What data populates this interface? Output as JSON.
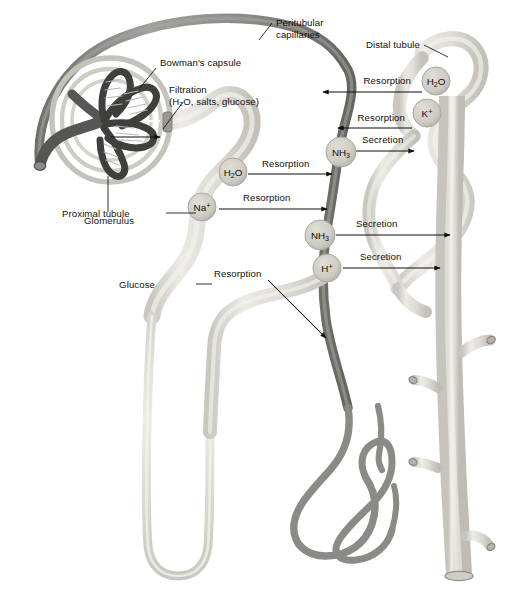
{
  "palette": {
    "background": "#ffffff",
    "tubule_fill": "#d8d6cf",
    "tubule_fill_light": "#e6e4dd",
    "tubule_edge": "#b3b0a7",
    "capillary": "#8d8d8a",
    "capillary_dark": "#6e6e6b",
    "glomerulus": "#4a4a49",
    "capsule": "#bdbcb6",
    "marker_fill": "#cfcdc5",
    "marker_edge": "#a9a79e",
    "text": "#100f0d",
    "leader": "#100f0d"
  },
  "labels": {
    "peritubular_capillaries_line1": "Peritubular",
    "peritubular_capillaries_line2": "capillaries",
    "distal_tubule": "Distal tubule",
    "bowmans_capsule": "Bowman's capsule",
    "filtration_line1": "Filtration",
    "filtration_line2": "(H₂O, salts, glucose)",
    "glomerulus": "Glomerulus",
    "proximal_tubule": "Proximal tubule",
    "glucose": "Glucose"
  },
  "markers": [
    {
      "id": "h2o-distal",
      "formula": "H",
      "sub": "2",
      "tail": "O",
      "sup": "",
      "cx": 436,
      "cy": 81
    },
    {
      "id": "k-plus",
      "formula": "K",
      "sub": "",
      "tail": "",
      "sup": "+",
      "cx": 427,
      "cy": 113
    },
    {
      "id": "nh3-upper",
      "formula": "NH",
      "sub": "3",
      "tail": "",
      "sup": "",
      "cx": 341,
      "cy": 152
    },
    {
      "id": "h2o-proximal",
      "formula": "H",
      "sub": "2",
      "tail": "O",
      "sup": "",
      "cx": 233,
      "cy": 172
    },
    {
      "id": "na-plus",
      "formula": "Na",
      "sub": "",
      "tail": "",
      "sup": "+",
      "cx": 202,
      "cy": 207
    },
    {
      "id": "nh3-lower",
      "formula": "NH",
      "sub": "3",
      "tail": "",
      "sup": "",
      "cx": 320,
      "cy": 235
    },
    {
      "id": "h-plus",
      "formula": "H",
      "sub": "",
      "tail": "",
      "sup": "+",
      "cx": 327,
      "cy": 268
    }
  ],
  "transport_arrows": [
    {
      "id": "resorption-h2o-distal",
      "label": "Resorption",
      "direction": "left",
      "label_x": 411,
      "label_y": 84
    },
    {
      "id": "resorption-k-plus",
      "label": "Resorption",
      "direction": "left",
      "label_x": 397,
      "label_y": 121
    },
    {
      "id": "secretion-nh3-upper",
      "label": "Secretion",
      "direction": "right",
      "label_x": 376,
      "label_y": 143
    },
    {
      "id": "resorption-h2o-proximal",
      "label": "Resorption",
      "direction": "right",
      "label_x": 294,
      "label_y": 166
    },
    {
      "id": "resorption-na-plus",
      "label": "Resorption",
      "direction": "right",
      "label_x": 279,
      "label_y": 196
    },
    {
      "id": "secretion-nh3-lower",
      "label": "Secretion",
      "direction": "right",
      "label_x": 377,
      "label_y": 221
    },
    {
      "id": "secretion-h-plus",
      "label": "Secretion",
      "direction": "right",
      "label_x": 379,
      "label_y": 258
    },
    {
      "id": "resorption-glucose",
      "label": "Resorption",
      "direction": "down-right",
      "label_x": 219,
      "label_y": 274
    }
  ]
}
